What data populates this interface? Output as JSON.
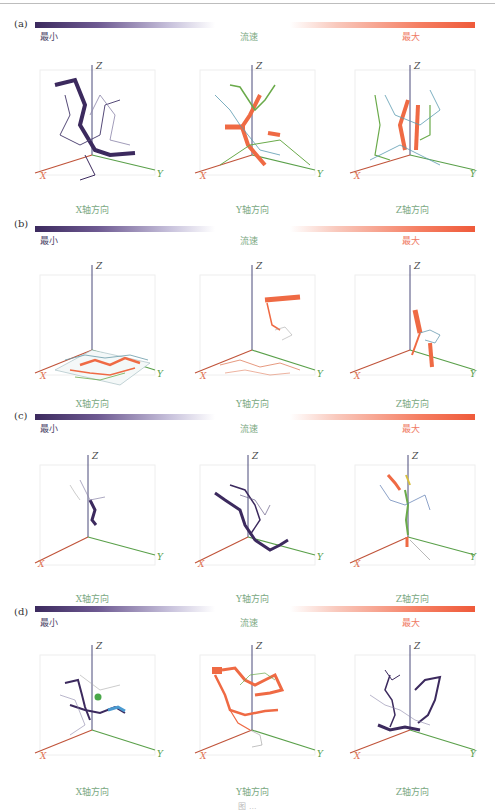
{
  "figure": {
    "colorbar": {
      "min_label": "最小",
      "mid_label": "流速",
      "max_label": "最大",
      "min_color": "#3c2a5e",
      "max_color": "#ef5a3a"
    },
    "axes": {
      "x": "X",
      "y": "Y",
      "z": "Z"
    },
    "axis_colors": {
      "x": "#c0543a",
      "y": "#5aa04a",
      "z": "#4a4a7a"
    },
    "directions": [
      "X轴方向",
      "Y轴方向",
      "Z轴方向"
    ],
    "panels": [
      {
        "label": "(a)"
      },
      {
        "label": "(b)"
      },
      {
        "label": "(c)"
      },
      {
        "label": "(d)"
      }
    ],
    "caption": "图 ..."
  }
}
